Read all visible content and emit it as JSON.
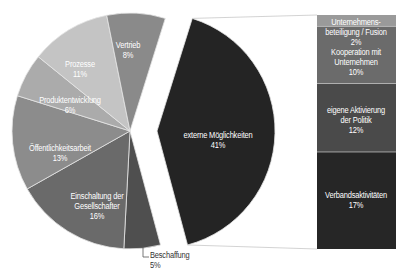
{
  "chart_data": {
    "type": "pie",
    "title": "",
    "center": [
      130,
      131
    ],
    "radius": 118,
    "exploded_offset": [
      27,
      0
    ],
    "slices": [
      {
        "label": "externe Möglichkeiten",
        "value": 41,
        "start_deg": 17.4,
        "end_deg": 165,
        "color": "#242424",
        "exploded": true
      },
      {
        "label": "Beschaffung",
        "value": 5,
        "start_deg": 165,
        "end_deg": 183,
        "color": "#4f4f4f"
      },
      {
        "label": "Einschaltung der Gesellschafter",
        "value": 16,
        "start_deg": 183,
        "end_deg": 240.6,
        "color": "#6a6a6a"
      },
      {
        "label": "Öffentlichkeitsarbeit",
        "value": 13,
        "start_deg": 240.6,
        "end_deg": 287.4,
        "color": "#8c8c8c"
      },
      {
        "label": "Produktentwicklung",
        "value": 6,
        "start_deg": 287.4,
        "end_deg": 309,
        "color": "#ababab"
      },
      {
        "label": "Prozesse",
        "value": 11,
        "start_deg": 309,
        "end_deg": 348.6,
        "color": "#c4c4c4"
      },
      {
        "label": "Vertrieb",
        "value": 8,
        "start_deg": 348.6,
        "end_deg": 377.4,
        "color": "#8a8a8a"
      }
    ],
    "breakdown_bar": {
      "of": "externe Möglichkeiten",
      "x": 317,
      "y": 15,
      "width": 79,
      "height": 234,
      "segments": [
        {
          "label": "Unternehmensbeteiligung / Fusion",
          "value": 2,
          "color": "#9a9a9a"
        },
        {
          "label": "Kooperation mit Unternehmen",
          "value": 10,
          "color": "#6b6b6b"
        },
        {
          "label": "eigene Aktivierung der Politik",
          "value": 12,
          "color": "#4a4a4a"
        },
        {
          "label": "Verbandsaktivitäten",
          "value": 17,
          "color": "#262626"
        }
      ]
    }
  },
  "labels": {
    "vertrieb": {
      "name": "Vertrieb",
      "pct": "8%"
    },
    "prozesse": {
      "name": "Prozesse",
      "pct": "11%"
    },
    "produkt": {
      "name": "Produktentwicklung",
      "pct": "6%"
    },
    "oeffentlich": {
      "name": "Öffentlichkeitsarbeit",
      "pct": "13%"
    },
    "einschaltung": {
      "line1": "Einschaltung der",
      "line2": "Gesellschafter",
      "pct": "16%"
    },
    "beschaffung": {
      "name": "Beschaffung",
      "pct": "5%"
    },
    "extern": {
      "name": "externe Möglichkeiten",
      "pct": "41%"
    },
    "beteiligung": {
      "line1": "Unternehmens-",
      "line2": "beteiligung / Fusion",
      "pct": "2%"
    },
    "kooperation": {
      "line1": "Kooperation mit",
      "line2": "Unternehmen",
      "pct": "10%"
    },
    "politik": {
      "line1": "eigene Aktivierung",
      "line2": "der Politik",
      "pct": "12%"
    },
    "verband": {
      "name": "Verbandsaktivitäten",
      "pct": "17%"
    }
  }
}
